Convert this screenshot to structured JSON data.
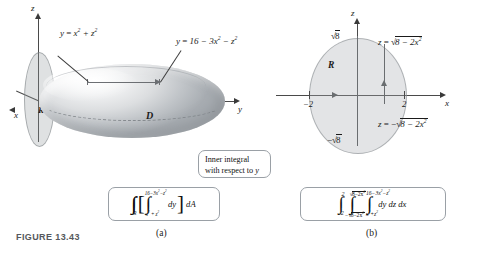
{
  "figure": {
    "caption": "FIGURE 13.43",
    "sub_label_a": "(a)",
    "sub_label_b": "(b)"
  },
  "panel_a": {
    "name": "solid-region-3d",
    "axes": {
      "z": "z",
      "x": "x",
      "y": "y"
    },
    "solid_label": "D",
    "disk_label": "R",
    "surface_lower": {
      "lhs": "y",
      "eq": "=",
      "rhs": "x² + z²"
    },
    "surface_upper": {
      "lhs": "y",
      "eq": "=",
      "rhs": "16 − 3x² − z²"
    },
    "integral": {
      "outer_sub": "R",
      "inner_upper": "16−3x²−z²",
      "inner_lower": "x² + z²",
      "inner_diff": "dy",
      "outer_diff": "dA"
    }
  },
  "callout": {
    "line1": "Inner integral",
    "line2_prefix": "with respect to ",
    "line2_var": "y"
  },
  "panel_b": {
    "name": "projection-region-2d",
    "axes": {
      "z": "z",
      "x": "x"
    },
    "region_label": "R",
    "tick_top": "√8",
    "tick_bottom": "−√8",
    "tick_left": "−2",
    "tick_right": "2",
    "curve_upper": {
      "lhs": "z",
      "eq": "=",
      "rhs": "√(8 − 2x²)"
    },
    "curve_lower": {
      "lhs": "z",
      "eq": "=",
      "rhs": "−√(8 − 2x²)"
    },
    "integral": {
      "x_lower": "−2",
      "x_upper": "2",
      "z_lower": "−√8−2x²",
      "z_upper": "√8−2x²",
      "y_lower": "x²+z²",
      "y_upper": "16−3x²−z²",
      "diffs": "dy dz dx"
    }
  },
  "colors": {
    "axis": "#4a4a4a",
    "solid_shade": "#c6cacd",
    "region_fill": "#aaaeb2",
    "box_border": "#9aa0a6",
    "text": "#1a1a1a"
  }
}
